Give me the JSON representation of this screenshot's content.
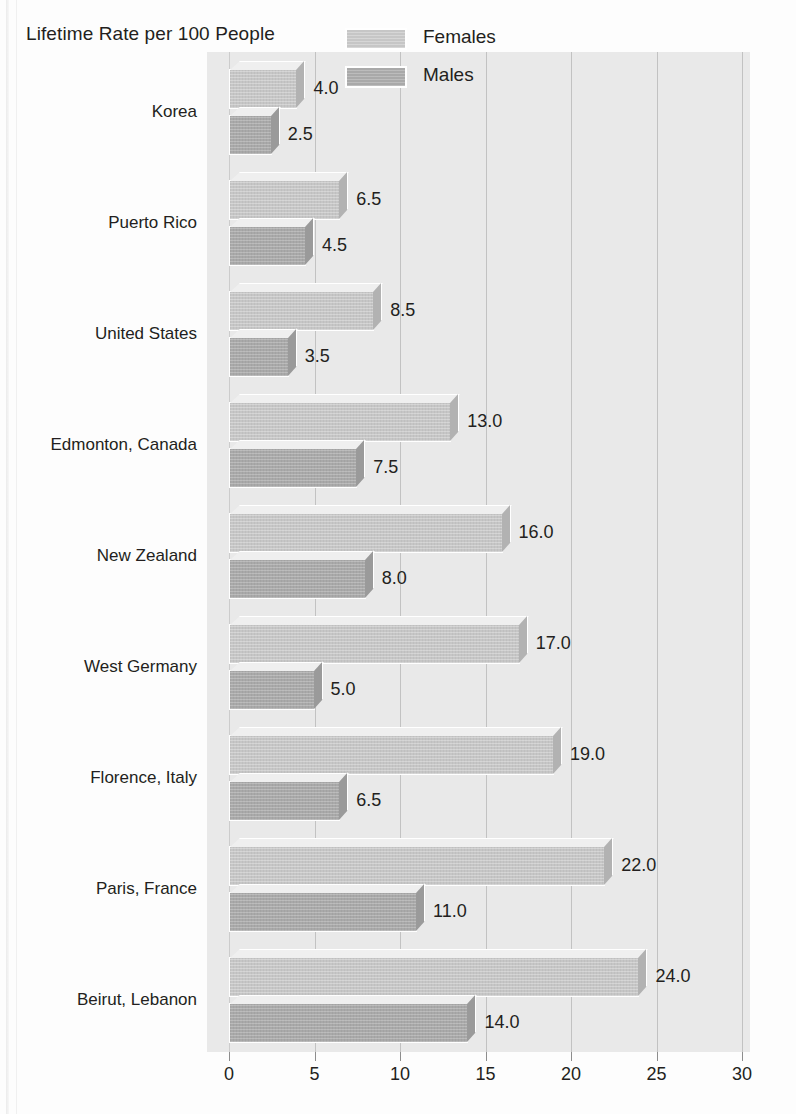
{
  "chart_title": "Lifetime Rate per 100 People",
  "legend": {
    "position": "top-right",
    "items": [
      {
        "label": "Females",
        "color": "#c6c6c6",
        "swatch_name": "legend-swatch-females"
      },
      {
        "label": "Males",
        "color": "#a9a9a9",
        "swatch_name": "legend-swatch-males"
      }
    ]
  },
  "axis": {
    "ticks": [
      "0",
      "5",
      "10",
      "15",
      "20",
      "25",
      "30"
    ],
    "min": 0,
    "max": 30
  },
  "chart_data": {
    "type": "bar",
    "orientation": "horizontal",
    "title": "Lifetime Rate per 100 People",
    "xlabel": "",
    "ylabel": "",
    "xlim": [
      0,
      30
    ],
    "grid": true,
    "legend_position": "top-right",
    "categories": [
      "Korea",
      "Puerto Rico",
      "United States",
      "Edmonton, Canada",
      "New Zealand",
      "West Germany",
      "Florence, Italy",
      "Paris, France",
      "Beirut, Lebanon"
    ],
    "series": [
      {
        "name": "Females",
        "color": "#c6c6c6",
        "values": [
          4.0,
          6.5,
          8.5,
          13.0,
          16.0,
          17.0,
          19.0,
          22.0,
          24.0
        ],
        "labels": [
          "4.0",
          "6.5",
          "8.5",
          "13.0",
          "16.0",
          "17.0",
          "19.0",
          "22.0",
          "24.0"
        ]
      },
      {
        "name": "Males",
        "color": "#a9a9a9",
        "values": [
          2.5,
          4.5,
          3.5,
          7.5,
          8.0,
          5.0,
          6.5,
          11.0,
          14.0
        ],
        "labels": [
          "2.5",
          "4.5",
          "3.5",
          "7.5",
          "8.0",
          "5.0",
          "6.5",
          "11.0",
          "14.0"
        ]
      }
    ]
  },
  "colors": {
    "plot_background": "#e9e9e9",
    "gridline": "#c2c2c2",
    "text": "#231f20",
    "female_bar": "#c6c6c6",
    "male_bar": "#a9a9a9"
  }
}
